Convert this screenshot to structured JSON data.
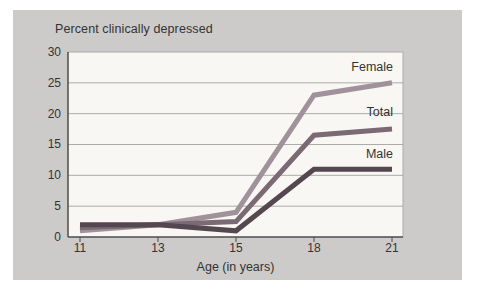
{
  "figure": {
    "title": "Percent clinically depressed",
    "x_axis_label": "Age (in years)"
  },
  "chart_data": {
    "type": "line",
    "title": "Percent clinically depressed",
    "xlabel": "Age (in years)",
    "ylabel": "",
    "categories": [
      "11",
      "13",
      "15",
      "18",
      "21"
    ],
    "x_values": [
      11,
      13,
      15,
      18,
      21
    ],
    "x_spacing": "equal",
    "ylim": [
      0,
      30
    ],
    "yticks": [
      "30",
      "25",
      "20",
      "15",
      "10",
      "5",
      "0"
    ],
    "grid": "horizontal",
    "legend_position": "inline-right-of-lines",
    "series": [
      {
        "name": "Female",
        "values": [
          1,
          2,
          4,
          23,
          25
        ],
        "color": "#a0929a"
      },
      {
        "name": "Total",
        "values": [
          1.5,
          2,
          2.5,
          16.5,
          17.5
        ],
        "color": "#7b6a73"
      },
      {
        "name": "Male",
        "values": [
          2,
          2,
          1,
          11,
          11
        ],
        "color": "#554750"
      }
    ],
    "colors": {
      "panel_background": "#cccbc9",
      "plot_background": "#f8f7f3",
      "gridline": "#ababa9",
      "axis": "#4c4c4c",
      "text": "#333333"
    }
  }
}
